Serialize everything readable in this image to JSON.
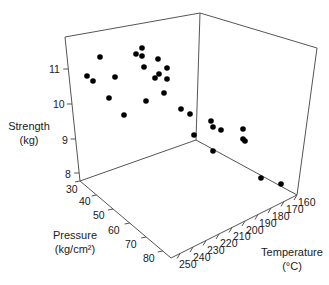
{
  "chart_data": {
    "type": "scatter3d",
    "title": "",
    "axes": {
      "z": {
        "label": "Strength",
        "unit": "(kg)",
        "ticks": [
          "8",
          "9",
          "10",
          "11"
        ],
        "range": [
          7.8,
          11.9
        ]
      },
      "x": {
        "label": "Pressure",
        "unit": "(kg/cm²)",
        "ticks": [
          "30",
          "40",
          "50",
          "60",
          "70",
          "80"
        ],
        "range": [
          30,
          85
        ]
      },
      "y": {
        "label": "Temperature",
        "unit": "(°C)",
        "ticks": [
          "160",
          "170",
          "180",
          "190",
          "200",
          "210",
          "220",
          "230",
          "240",
          "250"
        ],
        "range": [
          158,
          255
        ]
      }
    },
    "grid": false,
    "legend": null,
    "points_screen": [
      [
        100,
        57
      ],
      [
        87,
        76
      ],
      [
        93,
        81
      ],
      [
        115,
        77
      ],
      [
        109,
        98
      ],
      [
        124,
        115
      ],
      [
        136,
        54
      ],
      [
        142,
        48
      ],
      [
        142,
        56
      ],
      [
        144,
        67
      ],
      [
        146,
        101
      ],
      [
        158,
        59
      ],
      [
        167,
        68
      ],
      [
        159,
        74
      ],
      [
        155,
        78
      ],
      [
        167,
        79
      ],
      [
        164,
        93
      ],
      [
        181,
        109
      ],
      [
        190,
        114
      ],
      [
        194,
        135
      ],
      [
        211,
        121
      ],
      [
        213,
        127
      ],
      [
        221,
        130
      ],
      [
        243,
        129
      ],
      [
        243,
        139
      ],
      [
        245,
        141
      ],
      [
        213,
        151
      ],
      [
        261,
        178
      ],
      [
        281,
        184
      ]
    ],
    "point_count": 29
  },
  "labels": {
    "strength_title": "Strength",
    "strength_unit": "(kg)",
    "pressure_title": "Pressure",
    "pressure_unit": "(kg/cm²)",
    "temperature_title": "Temperature",
    "temperature_unit": "(°C)"
  }
}
